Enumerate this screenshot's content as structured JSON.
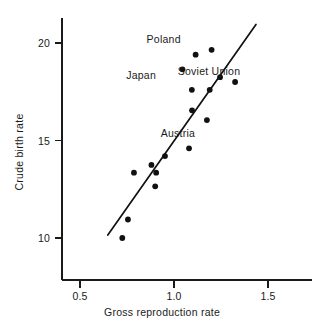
{
  "chart_data": {
    "type": "scatter",
    "title": "",
    "xlabel": "Gross reproduction rate",
    "ylabel": "Crude birth rate",
    "xlim": [
      0.37,
      1.6
    ],
    "ylim": [
      8.0,
      21.6
    ],
    "grid": false,
    "legend": null,
    "x_ticks": [
      {
        "value": 0.5,
        "label": "0.5"
      },
      {
        "value": 1.0,
        "label": "1.0"
      },
      {
        "value": 1.5,
        "label": "1.5"
      }
    ],
    "y_ticks": [
      {
        "value": 10,
        "label": "10"
      },
      {
        "value": 15,
        "label": "15"
      },
      {
        "value": 20,
        "label": "20"
      }
    ],
    "points": [
      {
        "x": 0.725,
        "y": 10.0,
        "label": null
      },
      {
        "x": 0.755,
        "y": 10.95,
        "label": null
      },
      {
        "x": 0.787,
        "y": 13.35,
        "label": null
      },
      {
        "x": 0.88,
        "y": 13.75,
        "label": null
      },
      {
        "x": 0.905,
        "y": 13.35,
        "label": null
      },
      {
        "x": 0.9,
        "y": 12.65,
        "label": null
      },
      {
        "x": 0.952,
        "y": 14.2,
        "label": null
      },
      {
        "x": 1.08,
        "y": 14.6,
        "label": null
      },
      {
        "x": 1.045,
        "y": 18.65,
        "label": "Japan"
      },
      {
        "x": 1.115,
        "y": 19.4,
        "label": "Poland"
      },
      {
        "x": 1.2,
        "y": 19.65,
        "label": null
      },
      {
        "x": 1.095,
        "y": 17.6,
        "label": null
      },
      {
        "x": 1.19,
        "y": 17.6,
        "label": null
      },
      {
        "x": 1.245,
        "y": 18.25,
        "label": null
      },
      {
        "x": 1.325,
        "y": 18.0,
        "label": "Soviet Union"
      },
      {
        "x": 1.096,
        "y": 16.55,
        "label": null
      },
      {
        "x": 1.175,
        "y": 16.05,
        "label": null
      }
    ],
    "annotations": [
      {
        "text": "Poland",
        "x": 1.035,
        "y": 20.2
      },
      {
        "text": "Japan",
        "x": 0.905,
        "y": 18.35
      },
      {
        "text": "Soviet Union",
        "x": 1.355,
        "y": 18.55
      },
      {
        "text": "Austria",
        "x": 1.11,
        "y": 15.4
      }
    ],
    "fit_line": {
      "type": "linear",
      "x_start": 0.648,
      "y_start": 10.15,
      "x_end": 1.436,
      "y_end": 20.95
    },
    "colors": {
      "axis": "#1a1a1a",
      "point": "#111111",
      "line": "#111111",
      "background": "#ffffff"
    }
  }
}
